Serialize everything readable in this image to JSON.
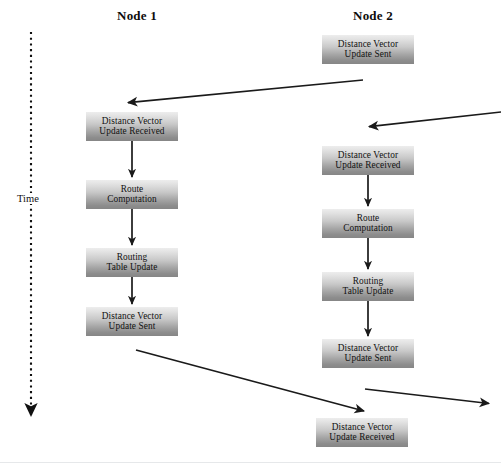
{
  "diagram": {
    "title_node1": "Node 1",
    "title_node2": "Node 2",
    "time_axis_label": "Time",
    "colors": {
      "box_gradient_top": "#ededed",
      "box_gradient_bottom": "#868686",
      "text": "#111111",
      "arrow": "#1a1a1a",
      "background": "#ffffff",
      "bottom_rule": "#e6e8ea"
    },
    "columns": [
      {
        "name": "Node 1",
        "x_center": 137
      },
      {
        "name": "Node 2",
        "x_center": 373
      }
    ],
    "boxes": [
      {
        "id": "n2-dv-sent-1",
        "column": "Node 2",
        "line1": "Distance Vector",
        "line2": "Update Sent",
        "x": 322,
        "y": 35
      },
      {
        "id": "n1-dv-received-1",
        "column": "Node 1",
        "line1": "Distance Vector",
        "line2": "Update Received",
        "x": 86,
        "y": 112
      },
      {
        "id": "n2-dv-received-1",
        "column": "Node 2",
        "line1": "Distance Vector",
        "line2": "Update Received",
        "x": 322,
        "y": 146
      },
      {
        "id": "n1-route-comp",
        "column": "Node 1",
        "line1": "Route",
        "line2": "Computation",
        "x": 86,
        "y": 180
      },
      {
        "id": "n2-route-comp",
        "column": "Node 2",
        "line1": "Route",
        "line2": "Computation",
        "x": 322,
        "y": 209
      },
      {
        "id": "n1-routing-table",
        "column": "Node 1",
        "line1": "Routing",
        "line2": "Table Update",
        "x": 86,
        "y": 248
      },
      {
        "id": "n2-routing-table",
        "column": "Node 2",
        "line1": "Routing",
        "line2": "Table Update",
        "x": 322,
        "y": 272
      },
      {
        "id": "n1-dv-sent-1",
        "column": "Node 1",
        "line1": "Distance Vector",
        "line2": "Update Sent",
        "x": 86,
        "y": 307
      },
      {
        "id": "n2-dv-sent-2",
        "column": "Node 2",
        "line1": "Distance Vector",
        "line2": "Update Sent",
        "x": 322,
        "y": 339
      },
      {
        "id": "n2-dv-received-2",
        "column": "Node 2",
        "line1": "Distance Vector",
        "line2": "Update Received",
        "x": 316,
        "y": 418
      }
    ],
    "arrows": [
      {
        "id": "n2-sent1-to-n1-received1",
        "kind": "diagonal",
        "from": [
          363,
          80
        ],
        "to": [
          126,
          103
        ]
      },
      {
        "id": "inbound-to-n2-received1",
        "kind": "diagonal",
        "from": [
          501,
          112
        ],
        "to": [
          367,
          127
        ]
      },
      {
        "id": "n1-received1-to-route",
        "kind": "vertical",
        "from": [
          132,
          141
        ],
        "to": [
          132,
          178
        ]
      },
      {
        "id": "n1-route-to-table",
        "kind": "vertical",
        "from": [
          132,
          209
        ],
        "to": [
          132,
          246
        ]
      },
      {
        "id": "n1-table-to-sent",
        "kind": "vertical",
        "from": [
          132,
          277
        ],
        "to": [
          132,
          305
        ]
      },
      {
        "id": "n2-received1-to-route",
        "kind": "vertical",
        "from": [
          368,
          175
        ],
        "to": [
          368,
          207
        ]
      },
      {
        "id": "n2-route-to-table",
        "kind": "vertical",
        "from": [
          368,
          238
        ],
        "to": [
          368,
          270
        ]
      },
      {
        "id": "n2-table-to-sent",
        "kind": "vertical",
        "from": [
          368,
          301
        ],
        "to": [
          368,
          337
        ]
      },
      {
        "id": "n1-sent1-to-n2-received2",
        "kind": "diagonal",
        "from": [
          136,
          350
        ],
        "to": [
          366,
          412
        ]
      },
      {
        "id": "n2-sent2-to-outbound",
        "kind": "diagonal",
        "from": [
          365,
          389
        ],
        "to": [
          491,
          404
        ]
      },
      {
        "id": "time-axis-arrow",
        "kind": "dashed-vertical",
        "from": [
          31,
          32
        ],
        "to": [
          31,
          419
        ]
      }
    ]
  }
}
